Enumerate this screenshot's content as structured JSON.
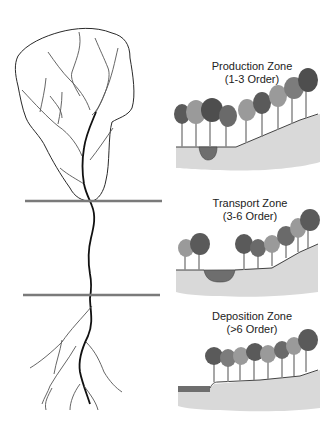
{
  "diagram": {
    "type": "stream-order-zones",
    "colors": {
      "boundary_line": "#7a7a7a",
      "main_channel": "#111111",
      "tributaries": "#555555",
      "watershed_outline": "#2a2a2a",
      "ground": "#d9d9d9",
      "ground_edge": "#444444",
      "water": "#6e6e6e",
      "tree_dark": "#5a5a5a",
      "tree_mid": "#7c7c7c",
      "tree_light": "#9a9a9a",
      "trunk": "#8a8a8a"
    },
    "boundaries": [
      {
        "label": "production-transport boundary",
        "y": 201
      },
      {
        "label": "transport-deposition boundary",
        "y": 295
      }
    ],
    "zones": [
      {
        "id": "production",
        "title": "Production Zone",
        "order": "(1-3 Order)"
      },
      {
        "id": "transport",
        "title": "Transport Zone",
        "order": "(3-6 Order)"
      },
      {
        "id": "deposition",
        "title": "Deposition Zone",
        "order": "(>6 Order)"
      }
    ]
  }
}
